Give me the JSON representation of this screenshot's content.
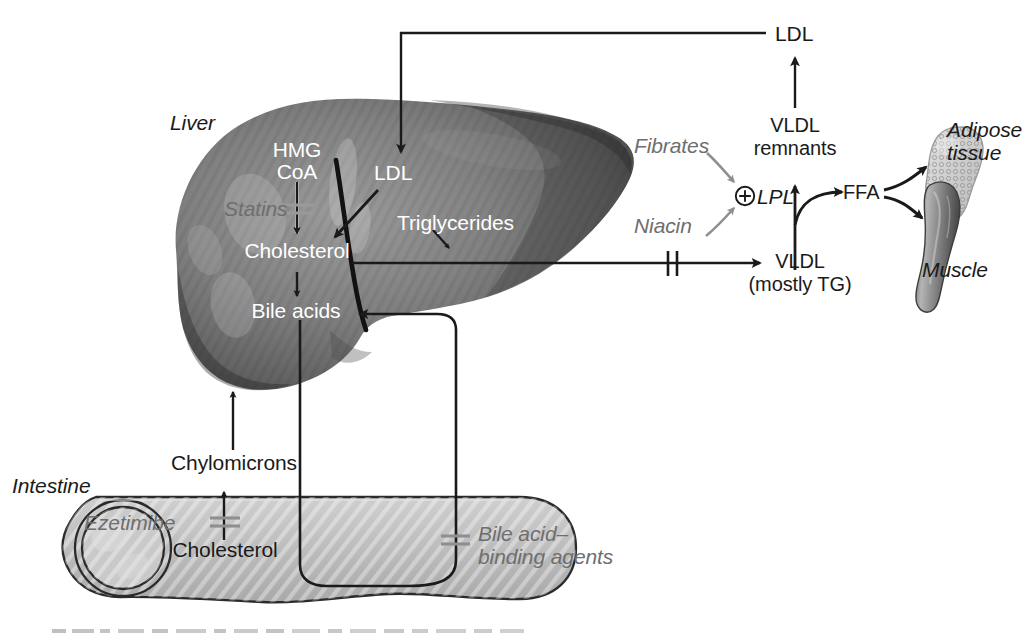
{
  "figure": {
    "domain": "biomedical-pathway-diagram",
    "width": 1025,
    "height": 633,
    "background": "#ffffff"
  },
  "organs": [
    {
      "id": "liver",
      "label": "Liver",
      "style": "italic",
      "fill": "#7d7d7d",
      "label_color": "#1a1a1a"
    },
    {
      "id": "intestine",
      "label": "Intestine",
      "style": "italic",
      "fill": "#bdbdbd",
      "label_color": "#1a1a1a"
    },
    {
      "id": "adipose",
      "label": "Adipose\ntissue",
      "style": "italic",
      "fill": "#d5d5d5",
      "label_color": "#1a1a1a"
    },
    {
      "id": "muscle",
      "label": "Muscle",
      "style": "italic",
      "fill": "#909090",
      "label_color": "#1a1a1a"
    }
  ],
  "organ_labels": {
    "liver": "Liver",
    "intestine": "Intestine",
    "adipose_line1": "Adipose",
    "adipose_line2": "tissue",
    "muscle": "Muscle"
  },
  "metabolites": {
    "ldl_circulating": "LDL",
    "ldl_liver": "LDL",
    "hmg_line1": "HMG",
    "hmg_line2": "CoA",
    "cholesterol_liver": "Cholesterol",
    "bile_acids": "Bile acids",
    "triglycerides": "Triglycerides",
    "vldl_remnants_line1": "VLDL",
    "vldl_remnants_line2": "remnants",
    "vldl_line1": "VLDL",
    "vldl_line2": "(mostly TG)",
    "ffa": "FFA",
    "lpl": "LPL",
    "chylomicrons": "Chylomicrons",
    "cholesterol_intestine": "Cholesterol"
  },
  "drugs": [
    {
      "id": "statins",
      "label": "Statins",
      "color": "#8a8a8a",
      "effect": "inhibit",
      "target": "HMG CoA → Cholesterol"
    },
    {
      "id": "ezetimibe",
      "label": "Ezetimibe",
      "color": "#8a8a8a",
      "effect": "inhibit",
      "target": "Intestinal cholesterol absorption"
    },
    {
      "id": "bile_acid",
      "label": "Bile acid–\nbinding agents",
      "color": "#8a8a8a",
      "effect": "inhibit",
      "target": "Bile acid reabsorption"
    },
    {
      "id": "fibrates",
      "label": "Fibrates",
      "color": "#8a8a8a",
      "effect": "activate",
      "target": "LPL"
    },
    {
      "id": "niacin",
      "label": "Niacin",
      "color": "#8a8a8a",
      "effect": "activate",
      "target": "LPL"
    }
  ],
  "drug_labels": {
    "statins": "Statins",
    "ezetimibe": "Ezetimibe",
    "bile_acid_line1": "Bile acid–",
    "bile_acid_line2": "binding agents",
    "fibrates": "Fibrates",
    "niacin": "Niacin"
  },
  "symbols": {
    "activation": "⊕",
    "inhibition": "double-bar"
  },
  "colors": {
    "stroke": "#1a1a1a",
    "white_text": "#ffffff",
    "gray_text": "#6e6e6e",
    "drug_gray": "#8a8a8a",
    "liver_mid": "#7d7d7d",
    "liver_dark": "#3a3a3a",
    "liver_light": "#a8a8a8",
    "intestine_fill": "#bdbdbd",
    "adipose_fill": "#d5d5d5",
    "muscle_fill": "#8f8f8f"
  },
  "edges": [
    {
      "from": "LDL (circulating)",
      "to": "LDL (liver)",
      "type": "arrow"
    },
    {
      "from": "HMG CoA",
      "to": "Cholesterol",
      "type": "arrow",
      "blocked_by": "Statins"
    },
    {
      "from": "LDL (liver)",
      "to": "Cholesterol",
      "type": "arrow"
    },
    {
      "from": "Cholesterol",
      "to": "Bile acids",
      "type": "arrow"
    },
    {
      "from": "Cholesterol",
      "to": "VLDL (mostly TG)",
      "type": "arrow",
      "blocked_by": "Niacin"
    },
    {
      "from": "Triglycerides",
      "to": "VLDL pathway",
      "type": "arrow"
    },
    {
      "from": "VLDL (mostly TG)",
      "to": "VLDL remnants",
      "type": "arrow"
    },
    {
      "from": "VLDL remnants",
      "to": "LDL (circulating)",
      "type": "arrow"
    },
    {
      "from": "VLDL",
      "to": "FFA",
      "type": "curved-arrow"
    },
    {
      "from": "FFA",
      "to": "Adipose tissue",
      "type": "curved-arrow"
    },
    {
      "from": "FFA",
      "to": "Muscle",
      "type": "curved-arrow"
    },
    {
      "from": "Fibrates",
      "to": "LPL",
      "type": "activation-arrow"
    },
    {
      "from": "Niacin",
      "to": "LPL",
      "type": "activation-arrow"
    },
    {
      "from": "Bile acids",
      "to": "Intestine lumen",
      "type": "loop"
    },
    {
      "from": "Intestine lumen",
      "to": "Bile acids",
      "type": "loop",
      "blocked_by": "Bile acid–binding agents"
    },
    {
      "from": "Cholesterol (intestine)",
      "to": "Chylomicrons",
      "type": "arrow",
      "blocked_by": "Ezetimibe"
    },
    {
      "from": "Chylomicrons",
      "to": "Liver",
      "type": "arrow"
    }
  ]
}
